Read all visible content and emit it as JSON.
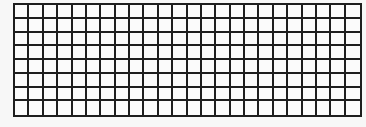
{
  "grid": {
    "rows": 8,
    "columns": 24,
    "line_color": "#1e1e1e",
    "cell_color": "#fbfbfb",
    "background_color": "#f7f7f7"
  }
}
